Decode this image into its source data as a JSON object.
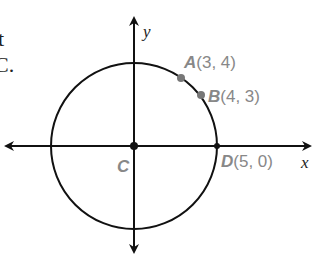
{
  "text_fragments": {
    "line1": "t",
    "line2": "C."
  },
  "axes": {
    "x_label": "x",
    "y_label": "y"
  },
  "circle": {
    "center_label": "C",
    "radius": 5
  },
  "points": [
    {
      "name": "A",
      "coords": "(3, 4)"
    },
    {
      "name": "B",
      "coords": "(4, 3)"
    },
    {
      "name": "C",
      "coords": ""
    },
    {
      "name": "D",
      "coords": "(5, 0)"
    }
  ],
  "colors": {
    "line": "#111111",
    "label": "#888888",
    "point": "#777777"
  }
}
